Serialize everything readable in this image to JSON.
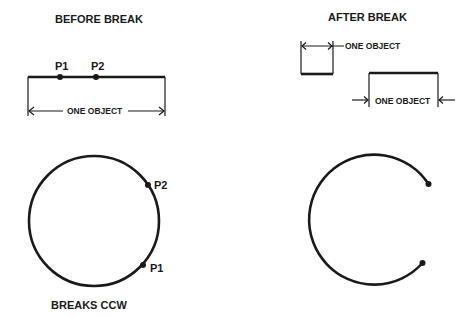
{
  "before": {
    "title": "BEFORE BREAK",
    "p1": "P1",
    "p2": "P2",
    "dimension_label": "ONE OBJECT"
  },
  "after": {
    "title": "AFTER BREAK",
    "dimension_label_1": "ONE OBJECT",
    "dimension_label_2": "ONE OBJECT"
  },
  "circle": {
    "p1": "P1",
    "p2": "P2",
    "caption": "BREAKS CCW"
  },
  "colors": {
    "stroke": "#1a1a1a",
    "background": "#ffffff"
  }
}
